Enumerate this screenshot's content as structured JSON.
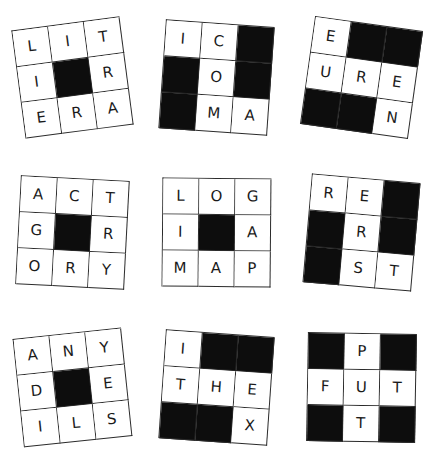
{
  "sheet": {
    "title": "Crossword Grid Worksheet",
    "background_color": "#ffffff",
    "ink_color": "#1a1a1a",
    "block_color": "#0d0d0d",
    "columns": 3,
    "rows": 3
  },
  "puzzles": [
    {
      "id": "puzzle-1",
      "rotation": "-7.5deg",
      "cells": [
        {
          "letter": "L",
          "blocked": false
        },
        {
          "letter": "I",
          "blocked": false
        },
        {
          "letter": "T",
          "blocked": false
        },
        {
          "letter": "I",
          "blocked": false
        },
        {
          "letter": "",
          "blocked": true
        },
        {
          "letter": "R",
          "blocked": false
        },
        {
          "letter": "E",
          "blocked": false
        },
        {
          "letter": "R",
          "blocked": false
        },
        {
          "letter": "A",
          "blocked": false
        }
      ]
    },
    {
      "id": "puzzle-2",
      "rotation": "4deg",
      "cells": [
        {
          "letter": "I",
          "blocked": false
        },
        {
          "letter": "C",
          "blocked": false
        },
        {
          "letter": "",
          "blocked": true
        },
        {
          "letter": "",
          "blocked": true
        },
        {
          "letter": "O",
          "blocked": false
        },
        {
          "letter": "",
          "blocked": true
        },
        {
          "letter": "",
          "blocked": true
        },
        {
          "letter": "M",
          "blocked": false
        },
        {
          "letter": "A",
          "blocked": false
        }
      ]
    },
    {
      "id": "puzzle-3",
      "rotation": "8deg",
      "cells": [
        {
          "letter": "E",
          "blocked": false
        },
        {
          "letter": "",
          "blocked": true
        },
        {
          "letter": "",
          "blocked": true
        },
        {
          "letter": "U",
          "blocked": false
        },
        {
          "letter": "R",
          "blocked": false
        },
        {
          "letter": "E",
          "blocked": false
        },
        {
          "letter": "",
          "blocked": true
        },
        {
          "letter": "",
          "blocked": true
        },
        {
          "letter": "N",
          "blocked": false
        }
      ]
    },
    {
      "id": "puzzle-4",
      "rotation": "3deg",
      "cells": [
        {
          "letter": "A",
          "blocked": false
        },
        {
          "letter": "C",
          "blocked": false
        },
        {
          "letter": "T",
          "blocked": false
        },
        {
          "letter": "G",
          "blocked": false
        },
        {
          "letter": "",
          "blocked": true
        },
        {
          "letter": "R",
          "blocked": false
        },
        {
          "letter": "O",
          "blocked": false
        },
        {
          "letter": "R",
          "blocked": false
        },
        {
          "letter": "Y",
          "blocked": false
        }
      ]
    },
    {
      "id": "puzzle-5",
      "rotation": "0.5deg",
      "cells": [
        {
          "letter": "L",
          "blocked": false
        },
        {
          "letter": "O",
          "blocked": false
        },
        {
          "letter": "G",
          "blocked": false
        },
        {
          "letter": "I",
          "blocked": false
        },
        {
          "letter": "",
          "blocked": true
        },
        {
          "letter": "A",
          "blocked": false
        },
        {
          "letter": "M",
          "blocked": false
        },
        {
          "letter": "A",
          "blocked": false
        },
        {
          "letter": "P",
          "blocked": false
        }
      ]
    },
    {
      "id": "puzzle-6",
      "rotation": "5deg",
      "cells": [
        {
          "letter": "R",
          "blocked": false
        },
        {
          "letter": "E",
          "blocked": false
        },
        {
          "letter": "",
          "blocked": true
        },
        {
          "letter": "",
          "blocked": true
        },
        {
          "letter": "R",
          "blocked": false
        },
        {
          "letter": "",
          "blocked": true
        },
        {
          "letter": "",
          "blocked": true
        },
        {
          "letter": "S",
          "blocked": false
        },
        {
          "letter": "T",
          "blocked": false
        }
      ]
    },
    {
      "id": "puzzle-7",
      "rotation": "-6deg",
      "cells": [
        {
          "letter": "A",
          "blocked": false
        },
        {
          "letter": "N",
          "blocked": false
        },
        {
          "letter": "Y",
          "blocked": false
        },
        {
          "letter": "D",
          "blocked": false
        },
        {
          "letter": "",
          "blocked": true
        },
        {
          "letter": "E",
          "blocked": false
        },
        {
          "letter": "I",
          "blocked": false
        },
        {
          "letter": "L",
          "blocked": false
        },
        {
          "letter": "S",
          "blocked": false
        }
      ]
    },
    {
      "id": "puzzle-8",
      "rotation": "4deg",
      "cells": [
        {
          "letter": "I",
          "blocked": false
        },
        {
          "letter": "",
          "blocked": true
        },
        {
          "letter": "",
          "blocked": true
        },
        {
          "letter": "T",
          "blocked": false
        },
        {
          "letter": "H",
          "blocked": false
        },
        {
          "letter": "E",
          "blocked": false
        },
        {
          "letter": "",
          "blocked": true
        },
        {
          "letter": "",
          "blocked": true
        },
        {
          "letter": "X",
          "blocked": false
        }
      ]
    },
    {
      "id": "puzzle-9",
      "rotation": "1deg",
      "cells": [
        {
          "letter": "",
          "blocked": true
        },
        {
          "letter": "P",
          "blocked": false
        },
        {
          "letter": "",
          "blocked": true
        },
        {
          "letter": "F",
          "blocked": false
        },
        {
          "letter": "U",
          "blocked": false
        },
        {
          "letter": "T",
          "blocked": false
        },
        {
          "letter": "",
          "blocked": true
        },
        {
          "letter": "T",
          "blocked": false
        },
        {
          "letter": "",
          "blocked": true
        }
      ]
    }
  ]
}
